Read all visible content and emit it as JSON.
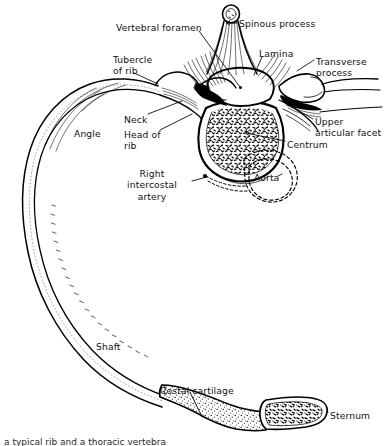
{
  "figure": {
    "domain": "anatomical-line-drawing",
    "width": 386,
    "height": 446,
    "background_color": "#ffffff",
    "ink_color": "#000000",
    "text_color": "#111111",
    "view": "superior (transverse) view of right rib articulating with thoracic vertebra"
  },
  "labels": [
    {
      "id": "spinous-process",
      "text": "Spinous process",
      "align": "left",
      "x": 239,
      "y": 18,
      "structure": "spinous process of vertebra"
    },
    {
      "id": "vertebral-foramen",
      "text": "Vertebral foramen",
      "align": "left",
      "x": 116,
      "y": 22,
      "structure": "vertebral foramen (spinal canal)"
    },
    {
      "id": "lamina",
      "text": "Lamina",
      "align": "left",
      "x": 259,
      "y": 48,
      "structure": "lamina of vertebral arch"
    },
    {
      "id": "transverse-process",
      "text": "Transverse\nprocess",
      "align": "left",
      "x": 316,
      "y": 56,
      "structure": "transverse process"
    },
    {
      "id": "tubercle-of-rib",
      "text": "Tubercle\nof rib",
      "align": "left",
      "x": 113,
      "y": 54,
      "structure": "tubercle of rib"
    },
    {
      "id": "neck",
      "text": "Neck",
      "align": "left",
      "x": 124,
      "y": 114,
      "structure": "neck of rib"
    },
    {
      "id": "head-of-rib",
      "text": "Head of\nrib",
      "align": "left",
      "x": 124,
      "y": 129,
      "structure": "head of rib"
    },
    {
      "id": "angle",
      "text": "Angle",
      "align": "left",
      "x": 74,
      "y": 128,
      "structure": "angle of rib"
    },
    {
      "id": "upper-articular-facet",
      "text": "Upper\narticular facet",
      "align": "left",
      "x": 315,
      "y": 116,
      "structure": "superior articular facet"
    },
    {
      "id": "centrum",
      "text": "Centrum",
      "align": "left",
      "x": 287,
      "y": 139,
      "structure": "centrum (vertebral body)"
    },
    {
      "id": "right-intercostal-artery",
      "text": "Right\nintercostal\nartery",
      "align": "center",
      "x": 152,
      "y": 168,
      "structure": "right posterior intercostal artery"
    },
    {
      "id": "aorta",
      "text": "Aorta",
      "align": "left",
      "x": 254,
      "y": 172,
      "structure": "descending thoracic aorta (dashed outline)"
    },
    {
      "id": "shaft",
      "text": "Shaft",
      "align": "left",
      "x": 96,
      "y": 341,
      "structure": "shaft (body) of rib"
    },
    {
      "id": "costal-cartilage",
      "text": "Costal cartilage",
      "align": "left",
      "x": 160,
      "y": 385,
      "structure": "costal cartilage (stippled)"
    },
    {
      "id": "sternum",
      "text": "Sternum",
      "align": "left",
      "x": 330,
      "y": 410,
      "structure": "sternum in cross-section"
    }
  ],
  "caption_partial": "a typical rib and a thoracic vertebra",
  "structures": [
    "rib",
    "thoracic vertebra",
    "aorta",
    "sternum",
    "costal cartilage"
  ]
}
